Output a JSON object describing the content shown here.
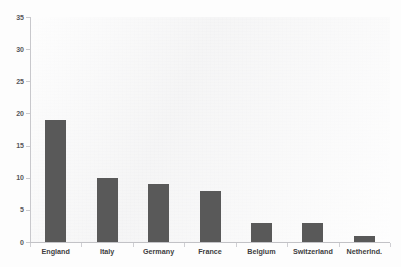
{
  "chart_data": {
    "type": "bar",
    "title": "",
    "subtitle": "",
    "xlabel": "",
    "ylabel": "",
    "categories": [
      "England",
      "Italy",
      "Germany",
      "France",
      "Belgium",
      "Switzerland",
      "Netherlnd."
    ],
    "values": [
      19,
      10,
      9,
      8,
      3,
      3,
      1
    ],
    "ylim": [
      0,
      35
    ],
    "yticks": [
      0,
      5,
      10,
      15,
      20,
      25,
      30,
      35
    ],
    "ytick_labels": [
      "0",
      "5",
      "10",
      "15",
      "20",
      "25",
      "30",
      "35"
    ],
    "grid": false,
    "legend": null,
    "series": [
      {
        "name": "count",
        "values": [
          19,
          10,
          9,
          8,
          3,
          3,
          1
        ]
      }
    ],
    "colors": {
      "bar": "#595959",
      "plot_background": "#f4f4f4",
      "axis_line": "#c8c8cc",
      "tick_label": "#3d3d41"
    }
  },
  "artifacts": {
    "top_edge_text": "",
    "bottom_edge_text": ""
  }
}
